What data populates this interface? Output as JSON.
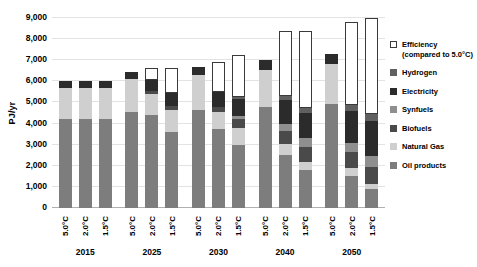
{
  "chart_data": {
    "type": "bar",
    "title": "",
    "subtitle": "",
    "xlabel": "",
    "ylabel": "PJ/yr",
    "ylim": [
      0,
      9000
    ],
    "ytick_labels": [
      "9,000",
      "8,000",
      "7,000",
      "6,000",
      "5,000",
      "4,000",
      "3,000",
      "2,000",
      "1,000",
      "0"
    ],
    "ytick_values": [
      9000,
      8000,
      7000,
      6000,
      5000,
      4000,
      3000,
      2000,
      1000,
      0
    ],
    "grid": true,
    "stacked": true,
    "legend_position": "right",
    "groups": [
      "2015",
      "2025",
      "2030",
      "2040",
      "2050"
    ],
    "scenarios": [
      "5.0°C",
      "2.0°C",
      "1.5°C"
    ],
    "series": [
      {
        "name": "Oil products",
        "color": "#7d7d7d",
        "values": [
          4200,
          4200,
          4200,
          4550,
          4400,
          3600,
          4650,
          3750,
          3000,
          4800,
          2500,
          1800,
          4950,
          1500,
          900
        ]
      },
      {
        "name": "Natural Gas",
        "color": "#cfcfcf",
        "values": [
          1500,
          1500,
          1500,
          1550,
          1000,
          1050,
          1650,
          800,
          800,
          1750,
          550,
          400,
          1850,
          400,
          250
        ]
      },
      {
        "name": "Biofuels",
        "color": "#4a4a4a",
        "values": [
          0,
          0,
          0,
          0,
          150,
          200,
          0,
          250,
          400,
          0,
          600,
          700,
          0,
          750,
          800
        ]
      },
      {
        "name": "Synfuels",
        "color": "#8f8f8f",
        "values": [
          0,
          0,
          0,
          0,
          0,
          0,
          0,
          0,
          150,
          0,
          350,
          400,
          0,
          450,
          500
        ]
      },
      {
        "name": "Electricity",
        "color": "#2b2b2b",
        "values": [
          300,
          300,
          300,
          350,
          500,
          600,
          400,
          700,
          800,
          450,
          1100,
          1200,
          500,
          1500,
          1650
        ]
      },
      {
        "name": "Hydrogen",
        "color": "#606060",
        "values": [
          0,
          0,
          0,
          0,
          0,
          0,
          0,
          0,
          100,
          0,
          200,
          250,
          0,
          300,
          350
        ]
      },
      {
        "name": "Efficiency (compared to 5.0°C)",
        "color": "#ffffff",
        "values": [
          0,
          0,
          0,
          0,
          600,
          1200,
          0,
          1400,
          2000,
          0,
          3100,
          3650,
          0,
          3900,
          4550
        ]
      }
    ]
  },
  "legend": {
    "items": [
      {
        "label": "Efficiency (compared to 5.0°C)",
        "color": "#ffffff",
        "outline": true
      },
      {
        "label": "Hydrogen",
        "color": "#606060",
        "outline": false
      },
      {
        "label": "Electricity",
        "color": "#2b2b2b",
        "outline": false
      },
      {
        "label": "Synfuels",
        "color": "#8f8f8f",
        "outline": false
      },
      {
        "label": "Biofuels",
        "color": "#4a4a4a",
        "outline": false
      },
      {
        "label": "Natural Gas",
        "color": "#cfcfcf",
        "outline": false
      },
      {
        "label": "Oil products",
        "color": "#7d7d7d",
        "outline": false
      }
    ]
  }
}
